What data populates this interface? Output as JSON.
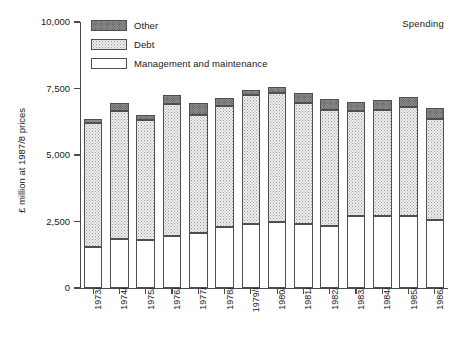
{
  "header": {
    "corner_title": "Spending"
  },
  "legend": {
    "position": "top-left-inside",
    "items": [
      {
        "label": "Other",
        "pattern": "dark-stipple",
        "color": "#8c8c8c"
      },
      {
        "label": "Debt",
        "pattern": "light-stipple",
        "color": "#f0f0f0"
      },
      {
        "label": "Management and maintenance",
        "pattern": "solid-white",
        "color": "#ffffff"
      }
    ]
  },
  "axes": {
    "y_title": "£ million at 1987/8 prices",
    "y_ticks": [
      "0",
      "2,500",
      "5,000",
      "7,500",
      "10,000"
    ],
    "y_tick_values": [
      0,
      2500,
      5000,
      7500,
      10000
    ],
    "y_min": 0,
    "y_max": 10000,
    "x_title": ""
  },
  "chart_data": {
    "type": "bar",
    "stacked": true,
    "title": "Spending",
    "xlabel": "",
    "ylabel": "£ million at 1987/8 prices",
    "ylim": [
      0,
      10000
    ],
    "grid": false,
    "legend_position": "top-left-inside",
    "categories": [
      "1973/4",
      "1974/5",
      "1975/6",
      "1976/7",
      "1977/8",
      "1978/9",
      "1979/80",
      "1980/1",
      "1981/2",
      "1982/3",
      "1983/4",
      "1984/5",
      "1985/6",
      "1986/7"
    ],
    "series": [
      {
        "name": "Management and maintenance",
        "values": [
          1550,
          1850,
          1800,
          1950,
          2050,
          2300,
          2400,
          2500,
          2400,
          2350,
          2700,
          2700,
          2700,
          2550
        ]
      },
      {
        "name": "Debt",
        "values": [
          4650,
          4800,
          4500,
          4950,
          4450,
          4550,
          4850,
          4850,
          4550,
          4350,
          3950,
          4000,
          4100,
          3800
        ]
      },
      {
        "name": "Other",
        "values": [
          150,
          300,
          200,
          350,
          450,
          300,
          200,
          200,
          400,
          400,
          350,
          350,
          400,
          400
        ]
      }
    ],
    "totals": [
      6350,
      6950,
      6500,
      7250,
      6950,
      7150,
      7450,
      7550,
      7350,
      7100,
      7000,
      7050,
      7200,
      6750
    ]
  }
}
